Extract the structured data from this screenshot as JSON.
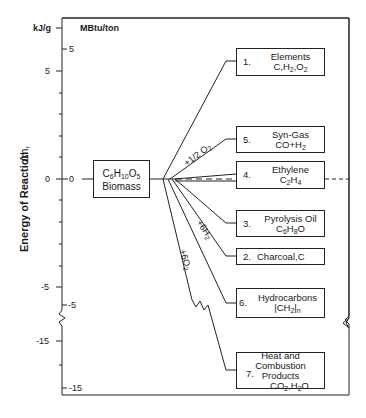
{
  "axis": {
    "title": "Energy of Reaction",
    "symbol": "Δh",
    "symbol_sub": "r",
    "left_unit": "kJ/g",
    "inner_unit": "MBtu/ton",
    "left_ticks": [
      {
        "label": "5",
        "y": 71
      },
      {
        "label": "0",
        "y": 179
      },
      {
        "label": "-5",
        "y": 287
      },
      {
        "label": "-15",
        "y": 341
      }
    ],
    "inner_ticks": [
      {
        "label": "5",
        "y": 49
      },
      {
        "label": "0",
        "y": 179
      },
      {
        "label": "-5",
        "y": 305
      },
      {
        "label": "-15",
        "y": 392
      }
    ]
  },
  "source": {
    "formula": "C6H10O5",
    "formula_parts": [
      "C",
      "6",
      "H",
      "10",
      "O",
      "5"
    ],
    "label": "Biomass"
  },
  "reagents": {
    "half_o2": "+1/2 O",
    "half_o2_sub": "2",
    "six_h2": "+6H",
    "six_h2_sub": "2",
    "six_o2": "+6O",
    "six_o2_sub": "2"
  },
  "products": [
    {
      "num": "1.",
      "name": "Elements",
      "formula": "C,H2,O2"
    },
    {
      "num": "5.",
      "name": "Syn-Gas",
      "formula": "CO+H2"
    },
    {
      "num": "4.",
      "name": "Ethylene",
      "formula": "C2H4"
    },
    {
      "num": "3.",
      "name": "Pyrolysis Oil",
      "formula": "C6H8O"
    },
    {
      "num": "2.",
      "name": "Charcoal,C",
      "formula": ""
    },
    {
      "num": "6.",
      "name": "Hydrocarbons",
      "formula": "(CH2)n"
    },
    {
      "num": "7.",
      "name": "Heat and Combustion",
      "name2": "Products",
      "formula": "CO2,H2O"
    }
  ]
}
